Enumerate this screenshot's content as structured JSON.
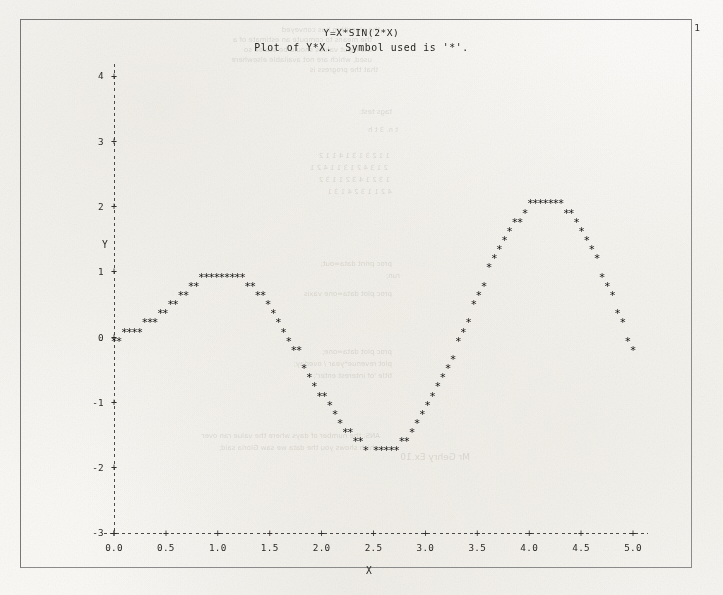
{
  "document": {
    "page_number": "1",
    "title": "Y=X*SIN(2*X)",
    "subtitle": "Plot of Y*X.  Symbol used is '*'."
  },
  "chart_data": {
    "type": "scatter",
    "title": "Y=X*SIN(2*X)",
    "subtitle": "Plot of Y*X.  Symbol used is '*'.",
    "xlabel": "X",
    "ylabel": "Y",
    "symbol": "*",
    "xlim": [
      0.0,
      5.1
    ],
    "ylim": [
      -3.0,
      4.3
    ],
    "grid": false,
    "legend": "none",
    "xticks": [
      "0.0",
      "0.5",
      "1.0",
      "1.5",
      "2.0",
      "2.5",
      "3.0",
      "3.5",
      "4.0",
      "4.5",
      "5.0"
    ],
    "xtick_values": [
      0.0,
      0.5,
      1.0,
      1.5,
      2.0,
      2.5,
      3.0,
      3.5,
      4.0,
      4.5,
      5.0
    ],
    "yticks": [
      "4",
      "3",
      "2",
      "1",
      "0",
      "-1",
      "-2",
      "-3"
    ],
    "ytick_values": [
      4,
      3,
      2,
      1,
      0,
      -1,
      -2,
      -3
    ],
    "equation": "Y = X * SIN(2*X)",
    "x": [
      0.0,
      0.05,
      0.1,
      0.15,
      0.2,
      0.25,
      0.3,
      0.35,
      0.4,
      0.45,
      0.5,
      0.55,
      0.6,
      0.65,
      0.7,
      0.75,
      0.8,
      0.85,
      0.9,
      0.95,
      1.0,
      1.05,
      1.1,
      1.15,
      1.2,
      1.25,
      1.3,
      1.35,
      1.4,
      1.45,
      1.5,
      1.55,
      1.6,
      1.65,
      1.7,
      1.75,
      1.8,
      1.85,
      1.9,
      1.95,
      2.0,
      2.05,
      2.1,
      2.15,
      2.2,
      2.25,
      2.3,
      2.35,
      2.4,
      2.45,
      2.5,
      2.55,
      2.6,
      2.65,
      2.7,
      2.75,
      2.8,
      2.85,
      2.9,
      2.95,
      3.0,
      3.05,
      3.1,
      3.15,
      3.2,
      3.25,
      3.3,
      3.35,
      3.4,
      3.45,
      3.5,
      3.55,
      3.6,
      3.65,
      3.7,
      3.75,
      3.8,
      3.85,
      3.9,
      3.95,
      4.0,
      4.05,
      4.1,
      4.15,
      4.2,
      4.25,
      4.3,
      4.35,
      4.4,
      4.45,
      4.5,
      4.55,
      4.6,
      4.65,
      4.7,
      4.75,
      4.8,
      4.85,
      4.9,
      4.95,
      5.0
    ],
    "y": [
      0.0,
      0.005,
      0.02,
      0.044,
      0.078,
      0.12,
      0.169,
      0.225,
      0.287,
      0.352,
      0.421,
      0.491,
      0.561,
      0.63,
      0.696,
      0.758,
      0.814,
      0.863,
      0.903,
      0.934,
      0.955,
      0.964,
      0.962,
      0.946,
      0.919,
      0.878,
      0.825,
      0.759,
      0.682,
      0.593,
      0.493,
      0.384,
      0.267,
      0.141,
      0.01,
      -0.127,
      -0.266,
      -0.408,
      -0.551,
      -0.693,
      -0.832,
      -0.966,
      -1.094,
      -1.214,
      -1.325,
      -1.425,
      -1.513,
      -1.588,
      -1.648,
      -1.693,
      -1.722,
      -1.735,
      -1.73,
      -1.708,
      -1.669,
      -1.613,
      -1.54,
      -1.451,
      -1.347,
      -1.228,
      -1.096,
      -0.951,
      -0.796,
      -0.631,
      -0.459,
      -0.28,
      -0.097,
      0.089,
      0.277,
      0.463,
      0.648,
      0.828,
      1.002,
      1.168,
      1.325,
      1.471,
      1.604,
      1.723,
      1.827,
      1.915,
      1.985,
      2.036,
      2.069,
      2.082,
      2.074,
      2.047,
      1.999,
      1.932,
      1.845,
      1.74,
      1.617,
      1.478,
      1.324,
      1.156,
      0.976,
      0.786,
      0.588,
      0.384,
      0.175,
      -0.036,
      -0.248
    ]
  }
}
